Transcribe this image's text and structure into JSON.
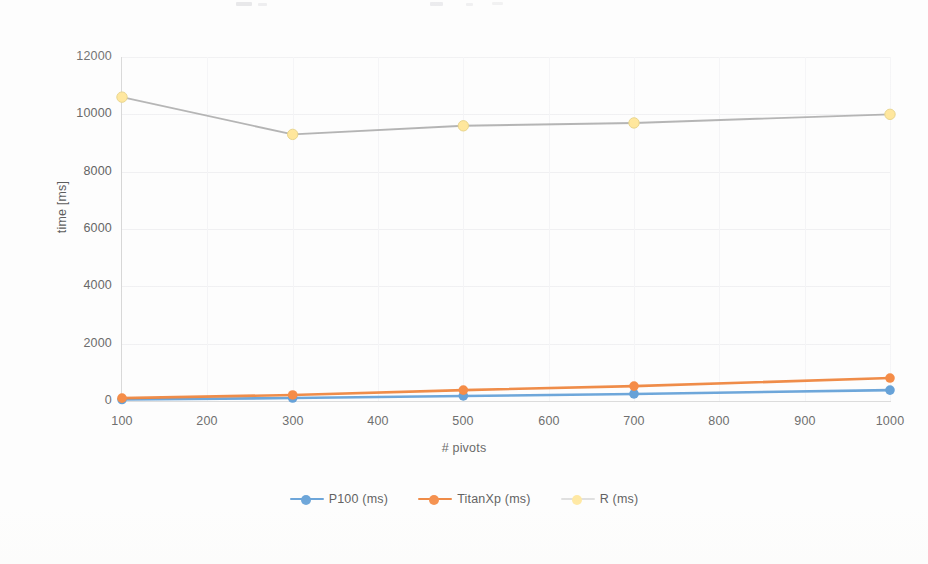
{
  "chart_data": {
    "type": "line",
    "title": "",
    "xlabel": "# pivots",
    "ylabel": "time [ms]",
    "x": [
      100,
      300,
      500,
      700,
      1000
    ],
    "xticks": [
      "100",
      "200",
      "300",
      "400",
      "500",
      "600",
      "700",
      "800",
      "900",
      "1000"
    ],
    "xtick_values": [
      100,
      200,
      300,
      400,
      500,
      600,
      700,
      800,
      900,
      1000
    ],
    "yticks": [
      "0",
      "2000",
      "4000",
      "6000",
      "8000",
      "10000",
      "12000"
    ],
    "ytick_values": [
      0,
      2000,
      4000,
      6000,
      8000,
      10000,
      12000
    ],
    "xlim": [
      100,
      1000
    ],
    "ylim": [
      0,
      12000
    ],
    "grid": true,
    "legend_position": "bottom",
    "markers": "circle",
    "series": [
      {
        "name": "P100 (ms)",
        "color": "#5b9bd5",
        "marker_color": "#5b9bd5",
        "values": [
          50,
          105,
          175,
          245,
          380
        ]
      },
      {
        "name": "TitanXp (ms)",
        "color": "#ed7d31",
        "marker_color": "#f4843a",
        "values": [
          100,
          210,
          380,
          520,
          800
        ]
      },
      {
        "name": "R (ms)",
        "color": "#a5a5a5",
        "marker_color": "#ffe699",
        "values": [
          10600,
          9300,
          9600,
          9700,
          10000
        ]
      }
    ]
  },
  "legend": {
    "items": [
      {
        "label": "P100 (ms)",
        "line_color": "#5b9bd5",
        "dot_color": "#5b9bd5"
      },
      {
        "label": "TitanXp (ms)",
        "line_color": "#ed7d31",
        "dot_color": "#f4843a"
      },
      {
        "label": "R (ms)",
        "line_color": "#d9d9d9",
        "dot_color": "#ffe699"
      }
    ]
  }
}
